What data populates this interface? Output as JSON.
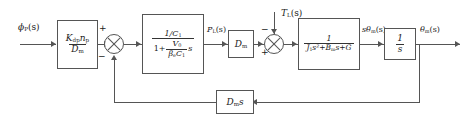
{
  "diagram": {
    "type": "control-system-block-diagram",
    "signals": {
      "input": "ϕ",
      "input_sub": "P",
      "input_arg": "(s)",
      "pressure": "P",
      "pressure_sub": "L",
      "pressure_arg": "(s)",
      "disturbance": "T",
      "disturbance_sub": "L",
      "disturbance_arg": "(s)",
      "speed": "sθ",
      "speed_sub": "m",
      "speed_arg": "(s)",
      "output": "θ",
      "output_sub": "m",
      "output_arg": "(s)"
    },
    "blocks": {
      "gain": {
        "numerator": "K",
        "numerator_sub1": "dp",
        "numerator_mid": "n",
        "numerator_sub2": "p",
        "denominator": "D",
        "denominator_sub": "m"
      },
      "compliance": {
        "numerator": "1/C",
        "numerator_sub": "1",
        "den_lead": "1+",
        "den_frac_num": "V",
        "den_frac_num_sub": "0",
        "den_frac_den": "β",
        "den_frac_den_sub": "e",
        "den_frac_den2": "C",
        "den_frac_den2_sub": "1",
        "den_tail": "s"
      },
      "displacement": {
        "label": "D",
        "label_sub": "m"
      },
      "mechanical": {
        "numerator": "1",
        "den_j": "J",
        "den_j_sub": "1",
        "den_j_sup": "s²",
        "den_plus1": "+",
        "den_b": "B",
        "den_b_sub": "m",
        "den_b_s": "s",
        "den_plus2": "+",
        "den_g": "G"
      },
      "integrator": {
        "numerator": "1",
        "denominator": "s"
      },
      "feedback": {
        "label": "D",
        "label_sub": "m",
        "label_tail": "s"
      }
    },
    "junctions": {
      "sum1_plus": "+",
      "sum1_minus": "−",
      "sum2_plus": "+",
      "sum2_minus": "−"
    },
    "colors": {
      "stroke": "#555555",
      "background": "#ffffff",
      "text": "#1a1a1a"
    }
  }
}
